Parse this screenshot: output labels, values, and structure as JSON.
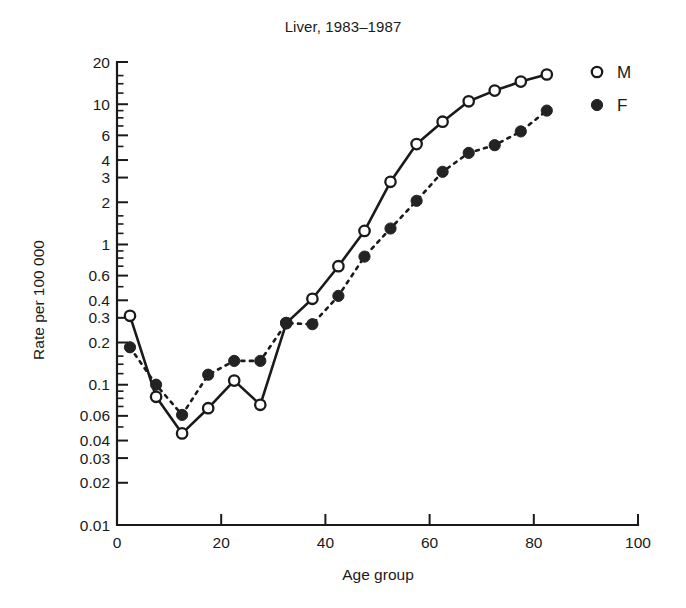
{
  "chart_data": {
    "type": "line",
    "title": "Liver, 1983–1987",
    "xlabel": "Age group",
    "ylabel": "Rate per 100 000",
    "yscale": "log",
    "ylim": [
      0.01,
      20
    ],
    "xlim": [
      0,
      100
    ],
    "grid": false,
    "legend_position": "right",
    "xticks": [
      0,
      20,
      40,
      60,
      80,
      100
    ],
    "xtick_labels": [
      "0",
      "20",
      "40",
      "60",
      "80",
      "100"
    ],
    "yticks": [
      20,
      10,
      6,
      4,
      3,
      2,
      1,
      0.6,
      0.4,
      0.3,
      0.2,
      0.1,
      0.06,
      0.04,
      0.03,
      0.02,
      0.01
    ],
    "ytick_labels": [
      "20",
      "10",
      "6",
      "4",
      "3",
      "2",
      "1",
      "0.6",
      "0.4",
      "0.3",
      "0.2",
      "0.1",
      "0.06",
      "0.04",
      "0.03",
      "0.02",
      "0.01"
    ],
    "yticks_minor": [
      16,
      14,
      12,
      9,
      8,
      7,
      5,
      1.6,
      1.4,
      1.2,
      0.9,
      0.8,
      0.7,
      0.5,
      0.16,
      0.14,
      0.12,
      0.09,
      0.08,
      0.07,
      0.05
    ],
    "x": [
      2.5,
      7.5,
      12.5,
      17.5,
      22.5,
      27.5,
      32.5,
      37.5,
      42.5,
      47.5,
      52.5,
      57.5,
      62.5,
      67.5,
      72.5,
      77.5,
      82.5
    ],
    "series": [
      {
        "name": "M",
        "label": "M",
        "marker": "open-circle",
        "linestyle": "solid",
        "color": "#1a1a1a",
        "values": [
          0.31,
          0.082,
          0.045,
          0.068,
          0.107,
          0.072,
          0.275,
          0.41,
          0.7,
          1.25,
          2.8,
          5.2,
          7.5,
          10.5,
          12.5,
          14.5,
          16.3
        ]
      },
      {
        "name": "F",
        "label": "F",
        "marker": "filled-circle",
        "linestyle": "dashed",
        "color": "#232323",
        "values": [
          0.185,
          0.1,
          0.061,
          0.118,
          0.148,
          0.148,
          0.275,
          0.27,
          0.43,
          0.82,
          1.3,
          2.05,
          3.3,
          4.5,
          5.1,
          6.4,
          9.0
        ]
      }
    ]
  },
  "legend": {
    "entries": [
      {
        "label": "M",
        "marker": "open-circle"
      },
      {
        "label": "F",
        "marker": "filled-circle"
      }
    ]
  }
}
